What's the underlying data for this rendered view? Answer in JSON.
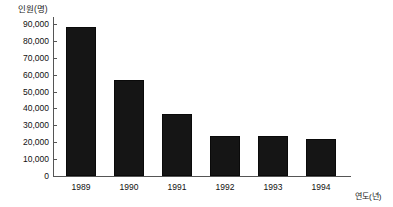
{
  "chart_data": {
    "type": "bar",
    "title": "",
    "subtitle": "",
    "xlabel": "연도(년)",
    "ylabel": "인원(명)",
    "categories": [
      "1989",
      "1990",
      "1991",
      "1992",
      "1993",
      "1994"
    ],
    "values": [
      88500,
      57000,
      36500,
      23500,
      23500,
      22000
    ],
    "ylim": [
      0,
      90000
    ],
    "ytick_values": [
      0,
      10000,
      20000,
      30000,
      40000,
      50000,
      60000,
      70000,
      80000,
      90000
    ],
    "ytick_labels": [
      "0",
      "10,000",
      "20,000",
      "30,000",
      "40,000",
      "50,000",
      "60,000",
      "70,000",
      "80,000",
      "90,000"
    ],
    "grid": false,
    "legend": null,
    "legend_position": "none",
    "bar_color": "#151515",
    "axis_color": "#555555",
    "text_color": "#111111",
    "background": "#ffffff"
  }
}
